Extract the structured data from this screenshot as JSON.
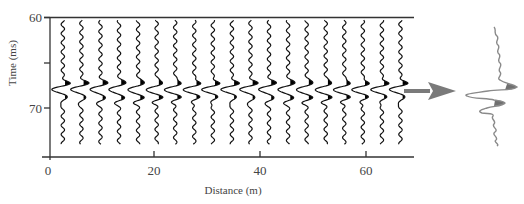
{
  "figure": {
    "y_axis": {
      "title": "Time (ms)",
      "ticks": [
        {
          "value": 60,
          "label": "60"
        },
        {
          "value": 65,
          "label": ""
        },
        {
          "value": 70,
          "label": "70"
        }
      ]
    },
    "x_axis": {
      "title": "Distance (m)",
      "ticks": [
        {
          "value": 0,
          "label": "0"
        },
        {
          "value": 20,
          "label": "20"
        },
        {
          "value": 40,
          "label": "40"
        },
        {
          "value": 60,
          "label": "60"
        }
      ]
    },
    "colors": {
      "axis": "#333333",
      "trace": "#111111",
      "trace_fill": "#000000",
      "arrow": "#7a7a7a",
      "enlarged_trace": "#8a8a8a",
      "enlarged_fill": "#707070"
    },
    "arrow_icon": "right-arrow",
    "enlarged_trace_label": ""
  },
  "chart_data": {
    "type": "wiggle-trace seismic section",
    "title": "",
    "xlabel": "Distance (m)",
    "ylabel": "Time (ms)",
    "xlim": [
      0,
      69
    ],
    "ylim": [
      60,
      77
    ],
    "y_inverted": true,
    "trace_count": 19,
    "trace_positions_m": [
      2.8,
      6.3,
      9.9,
      13.4,
      17.0,
      20.5,
      24.0,
      27.6,
      31.1,
      34.7,
      38.2,
      41.7,
      45.3,
      48.8,
      52.4,
      55.9,
      59.4,
      63.0,
      66.5
    ],
    "trace_time_range_ms": [
      60.3,
      74.0
    ],
    "wavelet": {
      "first_positive_peak_ms": 67.3,
      "trough_ms": 67.9,
      "second_positive_peak_ms": 68.8,
      "fill": "positive lobes filled black"
    },
    "annotation": "Arrow pointing from the section to an enlarged single trace on the right"
  }
}
